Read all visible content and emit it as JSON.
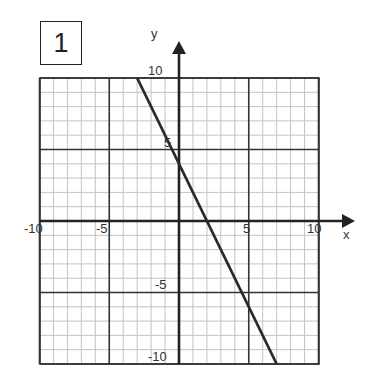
{
  "problem_number": "1",
  "chart_data": {
    "type": "line",
    "title": "",
    "xlabel": "x",
    "ylabel": "y",
    "xlim": [
      -10,
      10
    ],
    "ylim": [
      -10,
      10
    ],
    "grid": true,
    "grid_minor_step": 1,
    "grid_major_step": 5,
    "x_tick_labels": [
      "-10",
      "-5",
      "5",
      "10"
    ],
    "y_tick_labels": [
      "10",
      "5",
      "-5",
      "-10"
    ],
    "series": [
      {
        "name": "y = -2x + 4",
        "x": [
          -3,
          7
        ],
        "y": [
          10,
          -10
        ],
        "slope": -2,
        "intercept": 4
      }
    ]
  },
  "labels": {
    "x_axis": "x",
    "y_axis": "y",
    "xt_m10": "-10",
    "xt_m5": "-5",
    "xt_5": "5",
    "xt_10": "10",
    "yt_10": "10",
    "yt_5": "5",
    "yt_m5": "-5",
    "yt_m10": "-10"
  }
}
